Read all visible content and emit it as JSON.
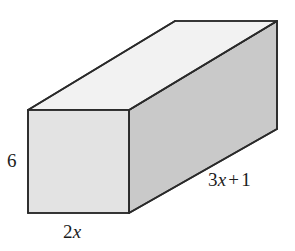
{
  "figure": {
    "name": "rectangular-prism",
    "background_color": "#ffffff",
    "stroke_color": "#2a2a2a",
    "faces": {
      "top": {
        "name": "top-face",
        "fill": "#f2f2f2"
      },
      "front": {
        "name": "front-face",
        "fill": "#e3e3e3"
      },
      "side": {
        "name": "right-side-face",
        "fill": "#c9c9c9"
      }
    },
    "geometry": {
      "front_top_left": [
        28,
        110
      ],
      "front_top_right": [
        129,
        110
      ],
      "front_bottom_right": [
        129,
        213
      ],
      "front_bottom_left": [
        28,
        213
      ],
      "back_top_left": [
        175,
        21
      ],
      "back_top_right": [
        277,
        21
      ],
      "back_bottom_right": [
        277,
        129
      ]
    }
  },
  "labels": {
    "height": {
      "value": "6",
      "edge": "vertical-left-edge"
    },
    "width": {
      "coefficient": "2",
      "variable": "x",
      "edge": "bottom-front-edge"
    },
    "length": {
      "coefficient": "3",
      "variable": "x",
      "operator": "+",
      "constant": "1",
      "edge": "bottom-right-edge"
    }
  }
}
